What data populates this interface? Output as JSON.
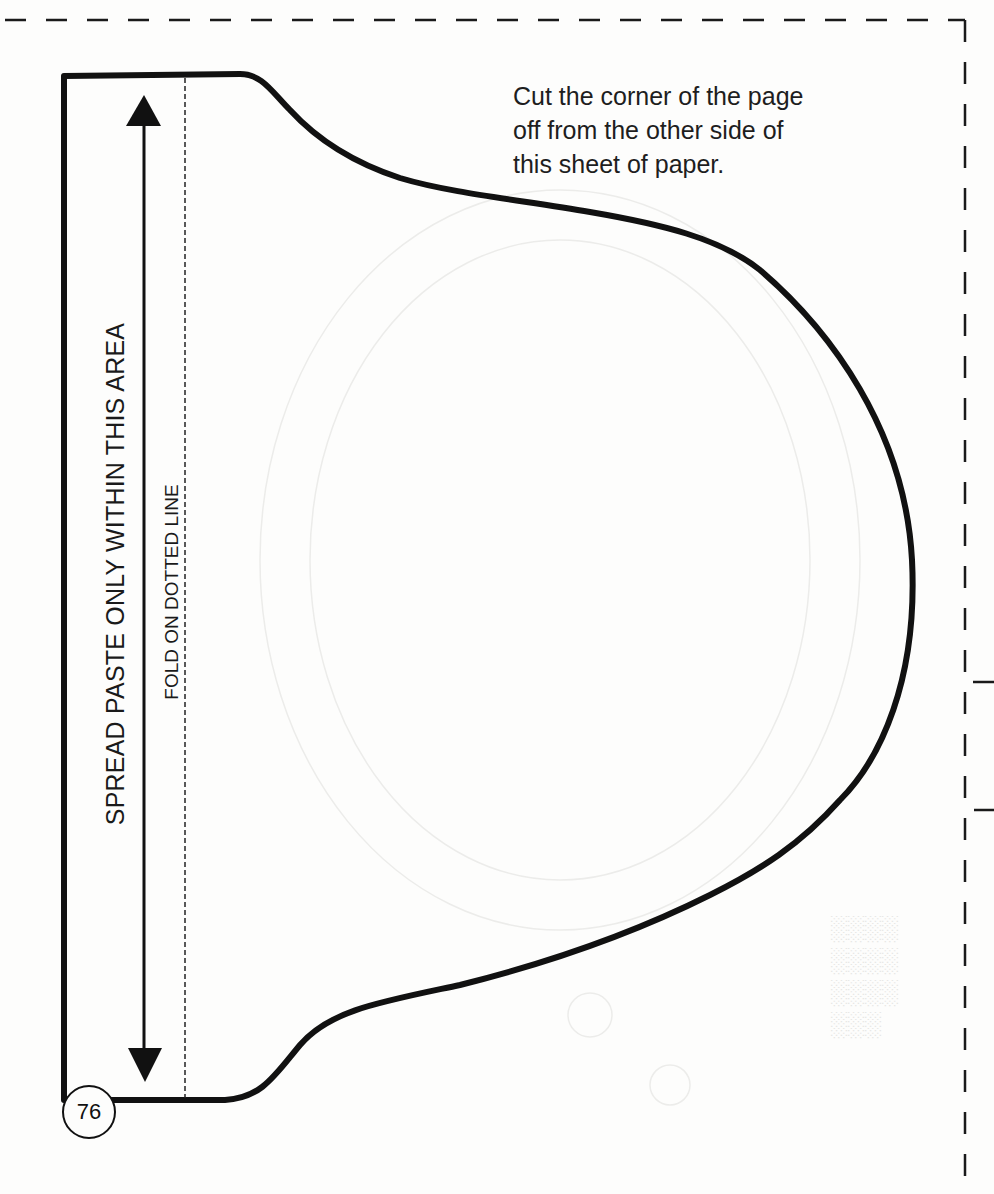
{
  "page": {
    "background": "#fdfdfc",
    "ink_color": "#111111",
    "page_number": "76"
  },
  "instruction": {
    "text": "Cut the corner of the page\noff from the other side of\nthis sheet of paper."
  },
  "template": {
    "paste_area_label": "SPREAD PASTE ONLY WITHIN THIS AREA",
    "fold_label": "FOLD ON DOTTED LINE"
  },
  "cut_border": {
    "style": "dashed",
    "top_y": 20,
    "right_x": 965
  }
}
